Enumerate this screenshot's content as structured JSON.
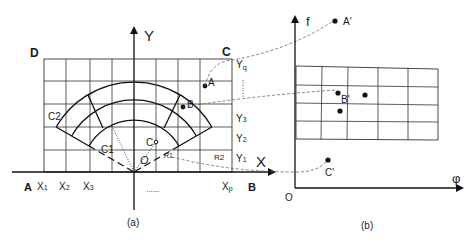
{
  "panel_a": {
    "caption": "(a)",
    "corners": {
      "top_left": "D",
      "top_right": "C",
      "bottom_left": "A",
      "bottom_right": "B"
    },
    "axes": {
      "x": "X",
      "y": "Y"
    },
    "x_ticks": [
      "X",
      "X",
      "X",
      "X"
    ],
    "x_tick_subs": [
      "1",
      "2",
      "3",
      "p"
    ],
    "y_ticks": [
      "Y",
      "Y",
      "Y",
      "Y"
    ],
    "y_tick_subs": [
      "q",
      "3",
      "2",
      "1"
    ],
    "ellipsis_x": "......",
    "points": {
      "A": "A",
      "B": "B",
      "C": "C",
      "O": "O"
    },
    "sector_labels": {
      "c1": "C1",
      "c2": "C2",
      "r1": "R1",
      "r2": "R2"
    }
  },
  "panel_b": {
    "caption": "(b)",
    "axes": {
      "vertical": "f",
      "horizontal": "φ",
      "origin": "O"
    },
    "points": {
      "A": "A'",
      "B": "B'",
      "C": "C'"
    }
  },
  "colors": {
    "ink": "#111111",
    "dashed": "#666666",
    "background": "#ffffff"
  }
}
